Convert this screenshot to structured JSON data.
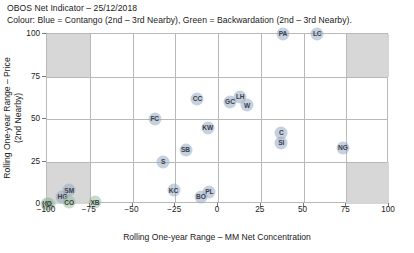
{
  "header": {
    "title": "OBOS Net Indicator – 25/12/2018",
    "subtitle": "Colour: Blue = Contango (2nd – 3rd Nearby), Green = Backwardation (2nd – 3rd Nearby)."
  },
  "colors": {
    "contango_blue": "#96aac8",
    "backwardation_green": "#96bea0",
    "shaded_quadrant": "#d5d5d5",
    "grid": "#b9b9b9",
    "text": "#1a1a1a"
  },
  "chart_data": {
    "type": "scatter",
    "title": "OBOS Net Indicator – 25/12/2018",
    "subtitle": "Colour: Blue = Contango (2nd – 3rd Nearby), Green = Backwardation (2nd – 3rd Nearby).",
    "xlabel": "Rolling One-year Range – MM Net Concentration",
    "ylabel": "Rolling One-year Range – Price (2nd Nearby)",
    "xlim": [
      -100,
      100
    ],
    "ylim": [
      0,
      100
    ],
    "xticks": [
      -100,
      -75,
      -50,
      -25,
      0,
      25,
      50,
      75,
      100
    ],
    "yticks": [
      0,
      25,
      50,
      75,
      100
    ],
    "xtick_labels": [
      "−100",
      "−75",
      "−50",
      "−25",
      "0",
      "25",
      "50",
      "75",
      "100"
    ],
    "ytick_labels": [
      "0",
      "25",
      "50",
      "75",
      "100"
    ],
    "grid": true,
    "legend": "none",
    "shaded_regions": [
      {
        "name": "top-left-quadrant",
        "x0": -100,
        "x1": -75,
        "y0": 75,
        "y1": 100
      },
      {
        "name": "top-right-quadrant",
        "x0": 75,
        "x1": 100,
        "y0": 75,
        "y1": 100
      },
      {
        "name": "bottom-left-quadrant",
        "x0": -100,
        "x1": -75,
        "y0": 0,
        "y1": 25
      },
      {
        "name": "bottom-right-quadrant",
        "x0": 75,
        "x1": 100,
        "y0": 0,
        "y1": 25
      }
    ],
    "points": [
      {
        "label": "PA",
        "x": 38,
        "y": 100,
        "color": "blue"
      },
      {
        "label": "LC",
        "x": 58,
        "y": 100,
        "color": "blue"
      },
      {
        "label": "CC",
        "x": -12,
        "y": 62,
        "color": "blue"
      },
      {
        "label": "LH",
        "x": 13,
        "y": 63,
        "color": "blue"
      },
      {
        "label": "GC",
        "x": 7,
        "y": 60,
        "color": "blue"
      },
      {
        "label": "W",
        "x": 17,
        "y": 58,
        "color": "blue"
      },
      {
        "label": "FC",
        "x": -37,
        "y": 50,
        "color": "blue"
      },
      {
        "label": "KW",
        "x": -6,
        "y": 45,
        "color": "blue"
      },
      {
        "label": "C",
        "x": 37,
        "y": 42,
        "color": "blue"
      },
      {
        "label": "SI",
        "x": 37,
        "y": 36,
        "color": "blue"
      },
      {
        "label": "NG",
        "x": 73,
        "y": 33,
        "color": "blue"
      },
      {
        "label": "SB",
        "x": -19,
        "y": 32,
        "color": "blue"
      },
      {
        "label": "S",
        "x": -32,
        "y": 25,
        "color": "blue"
      },
      {
        "label": "KC",
        "x": -26,
        "y": 8,
        "color": "blue"
      },
      {
        "label": "PL",
        "x": -5,
        "y": 7,
        "color": "blue"
      },
      {
        "label": "BO",
        "x": -10,
        "y": 4,
        "color": "blue"
      },
      {
        "label": "XB",
        "x": -72,
        "y": 1,
        "color": "green"
      },
      {
        "label": "SM",
        "x": -87,
        "y": 8,
        "color": "blue"
      },
      {
        "label": "HG",
        "x": -91,
        "y": 4,
        "color": "blue"
      },
      {
        "label": "CO",
        "x": -87,
        "y": 1,
        "color": "green"
      },
      {
        "label": "CL",
        "x": -99,
        "y": 0,
        "color": "green"
      },
      {
        "label": "HO",
        "x": -100,
        "y": 0,
        "color": "green"
      }
    ]
  }
}
